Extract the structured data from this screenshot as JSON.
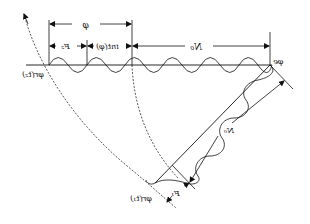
{
  "diagram": {
    "orientation": "horizontally mirrored",
    "labels": {
      "phi": "φ",
      "F2": "F₂",
      "int_phi": "int(φ)",
      "N0_top": "N₀",
      "N0_diag": "N₀",
      "F1": "F₁",
      "phi_r_t2": "φr(t₂)",
      "phi_r_t1": "φr(t₁)",
      "phi_e": "φe"
    },
    "colors": {
      "stroke": "#111111",
      "background": "#ffffff"
    }
  }
}
